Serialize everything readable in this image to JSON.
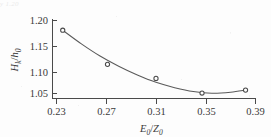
{
  "figure": {
    "scan_artifact_text": "y  1.20",
    "axis_color": "#4a4a4a",
    "curve_color": "#5a5a5a",
    "marker_color": "#4a4a4a",
    "text_color": "#3a3a3a"
  },
  "chart_data": {
    "type": "scatter",
    "title": "",
    "subtitle": "",
    "xlabel": "E₀/Z₀",
    "ylabel": "Hₖ/h₀",
    "xlabel_parts": {
      "main": "E",
      "sub": "0",
      "sep": "/",
      "main2": "Z",
      "sub2": "0"
    },
    "ylabel_parts": {
      "main": "H",
      "sub": "k",
      "sep": "/",
      "main2": "h",
      "sub2": "0"
    },
    "xlim": [
      0.21,
      0.395
    ],
    "ylim": [
      1.038,
      1.205
    ],
    "xticks": [
      0.23,
      0.27,
      0.31,
      0.35,
      0.39
    ],
    "xticklabels": [
      "0.23",
      "0.27",
      "0.31",
      "0.35",
      "0.39"
    ],
    "yticks": [
      1.05,
      1.1,
      1.15,
      1.2
    ],
    "yticklabels": [
      "1.05",
      "1.10",
      "1.15",
      "1.20"
    ],
    "grid": false,
    "legend": null,
    "spines": [
      "left",
      "bottom"
    ],
    "tick_direction": "in",
    "marker_style": "open-circle",
    "x": [
      0.235,
      0.271,
      0.31,
      0.347,
      0.382
    ],
    "y": [
      1.18,
      1.11,
      1.081,
      1.051,
      1.057
    ],
    "series": [
      {
        "name": "measured",
        "x": [
          0.235,
          0.271,
          0.31,
          0.347,
          0.382
        ],
        "values": [
          1.18,
          1.11,
          1.081,
          1.051,
          1.057
        ]
      },
      {
        "name": "fitted-curve",
        "type": "line",
        "x": [
          0.235,
          0.25,
          0.265,
          0.28,
          0.295,
          0.31,
          0.325,
          0.34,
          0.355,
          0.37,
          0.382
        ],
        "values": [
          1.18,
          1.152,
          1.127,
          1.106,
          1.088,
          1.073,
          1.062,
          1.054,
          1.0505,
          1.0525,
          1.057
        ]
      }
    ],
    "annotations": []
  }
}
